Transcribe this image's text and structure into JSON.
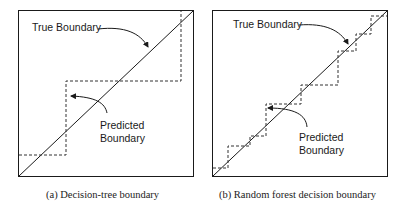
{
  "figure": {
    "panels": [
      {
        "id": "a",
        "caption": "(a) Decision-tree boundary",
        "true_label": "True Boundary",
        "predicted_label_line1": "Predicted",
        "predicted_label_line2": "Boundary"
      },
      {
        "id": "b",
        "caption": "(b) Random forest decision boundary",
        "true_label": "True Boundary",
        "predicted_label_line1": "Predicted",
        "predicted_label_line2": "Boundary"
      }
    ],
    "colors": {
      "line": "#1a1a1a",
      "dashed": "#333333",
      "background": "#ffffff"
    }
  }
}
